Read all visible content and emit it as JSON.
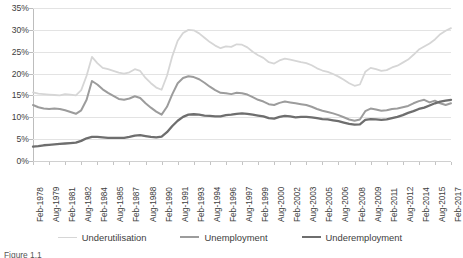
{
  "chart_data": {
    "type": "line",
    "title": "",
    "subtitle": "",
    "xlabel": "",
    "ylabel": "",
    "ylim": [
      0,
      35
    ],
    "ytick_labels": [
      "0%",
      "5%",
      "10%",
      "15%",
      "20%",
      "25%",
      "30%",
      "35%"
    ],
    "ytick_values": [
      0,
      5,
      10,
      15,
      20,
      25,
      30,
      35
    ],
    "grid": true,
    "legend_position": "bottom",
    "tick_labels": [
      "Feb-1978",
      "Aug-1979",
      "Feb-1981",
      "Aug-1982",
      "Feb-1984",
      "Aug-1985",
      "Feb-1987",
      "Aug-1988",
      "Feb-1990",
      "Aug-1991",
      "Feb-1993",
      "Aug-1994",
      "Feb-1996",
      "Aug-1997",
      "Feb-1999",
      "Aug-2000",
      "Feb-2002",
      "Aug-2003",
      "Feb-2005",
      "Aug-2006",
      "Feb-2008",
      "Aug-2009",
      "Feb-2011",
      "Aug-2012",
      "Feb-2014",
      "Aug-2015",
      "Feb-2017"
    ],
    "x": [
      1978.1,
      1978.6,
      1979.1,
      1979.6,
      1980.1,
      1980.6,
      1981.1,
      1981.6,
      1982.1,
      1982.6,
      1983.1,
      1983.6,
      1984.1,
      1984.6,
      1985.1,
      1985.6,
      1986.1,
      1986.6,
      1987.1,
      1987.6,
      1988.1,
      1988.6,
      1989.1,
      1989.6,
      1990.1,
      1990.6,
      1991.1,
      1991.6,
      1992.1,
      1992.6,
      1993.1,
      1993.6,
      1994.1,
      1994.6,
      1995.1,
      1995.6,
      1996.1,
      1996.6,
      1997.1,
      1997.6,
      1998.1,
      1998.6,
      1999.1,
      1999.6,
      2000.1,
      2000.6,
      2001.1,
      2001.6,
      2002.1,
      2002.6,
      2003.1,
      2003.6,
      2004.1,
      2004.6,
      2005.1,
      2005.6,
      2006.1,
      2006.6,
      2007.1,
      2007.6,
      2008.1,
      2008.6,
      2009.1,
      2009.6,
      2010.1,
      2010.6,
      2011.1,
      2011.6,
      2012.1,
      2012.6,
      2013.1,
      2013.6,
      2014.1,
      2014.6,
      2015.1,
      2015.6,
      2016.1,
      2016.6,
      2017.1
    ],
    "series": [
      {
        "name": "Underutilisation",
        "color": "#d6d6d6",
        "width": 1.8,
        "values": [
          15.7,
          15.4,
          15.3,
          15.2,
          15.1,
          15.0,
          15.3,
          15.2,
          15.0,
          16.2,
          19.5,
          23.8,
          22.4,
          21.3,
          21.0,
          20.6,
          20.2,
          20.0,
          20.3,
          21.0,
          20.6,
          19.0,
          17.8,
          16.8,
          16.3,
          19.5,
          24.0,
          27.5,
          29.3,
          30.0,
          29.9,
          29.2,
          28.2,
          27.2,
          26.4,
          25.8,
          26.2,
          26.1,
          26.7,
          26.6,
          26.0,
          25.0,
          24.2,
          23.6,
          22.6,
          22.3,
          23.0,
          23.4,
          23.2,
          22.9,
          22.6,
          22.4,
          21.9,
          21.2,
          20.7,
          20.4,
          19.9,
          19.3,
          18.6,
          17.8,
          17.2,
          17.5,
          20.4,
          21.3,
          21.0,
          20.6,
          20.8,
          21.4,
          21.8,
          22.5,
          23.2,
          24.3,
          25.5,
          26.2,
          26.9,
          27.8,
          29.0,
          29.8,
          30.4
        ]
      },
      {
        "name": "Unemployment",
        "color": "#9c9c9c",
        "width": 2.0,
        "values": [
          12.8,
          12.3,
          12.0,
          11.9,
          12.0,
          11.9,
          11.6,
          11.2,
          10.8,
          11.6,
          14.0,
          18.3,
          17.5,
          16.4,
          15.6,
          14.9,
          14.2,
          14.0,
          14.3,
          14.8,
          14.4,
          13.2,
          12.2,
          11.3,
          10.6,
          12.4,
          15.3,
          17.8,
          19.0,
          19.4,
          19.2,
          18.7,
          17.9,
          17.0,
          16.2,
          15.6,
          15.5,
          15.3,
          15.6,
          15.5,
          15.2,
          14.6,
          14.0,
          13.6,
          13.0,
          12.8,
          13.3,
          13.6,
          13.4,
          13.2,
          13.0,
          12.8,
          12.4,
          11.9,
          11.5,
          11.2,
          10.9,
          10.5,
          10.0,
          9.5,
          9.2,
          9.5,
          11.4,
          12.0,
          11.8,
          11.5,
          11.6,
          11.9,
          12.0,
          12.3,
          12.6,
          13.2,
          13.7,
          14.0,
          13.4,
          13.8,
          13.2,
          12.8,
          13.2
        ]
      },
      {
        "name": "Underemployment",
        "color": "#6e6e6e",
        "width": 2.3,
        "values": [
          3.3,
          3.4,
          3.6,
          3.7,
          3.8,
          3.9,
          4.0,
          4.1,
          4.2,
          4.6,
          5.2,
          5.5,
          5.5,
          5.4,
          5.3,
          5.3,
          5.3,
          5.3,
          5.5,
          5.8,
          5.9,
          5.7,
          5.5,
          5.4,
          5.6,
          6.6,
          8.0,
          9.2,
          10.1,
          10.6,
          10.7,
          10.6,
          10.4,
          10.3,
          10.2,
          10.2,
          10.5,
          10.6,
          10.8,
          10.9,
          10.8,
          10.6,
          10.4,
          10.2,
          9.8,
          9.7,
          10.1,
          10.3,
          10.2,
          10.0,
          10.1,
          10.1,
          10.0,
          9.8,
          9.6,
          9.5,
          9.3,
          9.1,
          8.8,
          8.5,
          8.3,
          8.4,
          9.4,
          9.6,
          9.5,
          9.4,
          9.5,
          9.8,
          10.1,
          10.5,
          11.0,
          11.4,
          11.9,
          12.2,
          12.7,
          13.2,
          13.6,
          13.8,
          14.0
        ]
      }
    ]
  },
  "legend": {
    "items": [
      {
        "label": "Underutilisation",
        "color": "#d6d6d6",
        "width": 1.8
      },
      {
        "label": "Unemployment",
        "color": "#9c9c9c",
        "width": 2.0
      },
      {
        "label": "Underemployment",
        "color": "#6e6e6e",
        "width": 2.3
      }
    ]
  },
  "caption": "Figure 1.1"
}
